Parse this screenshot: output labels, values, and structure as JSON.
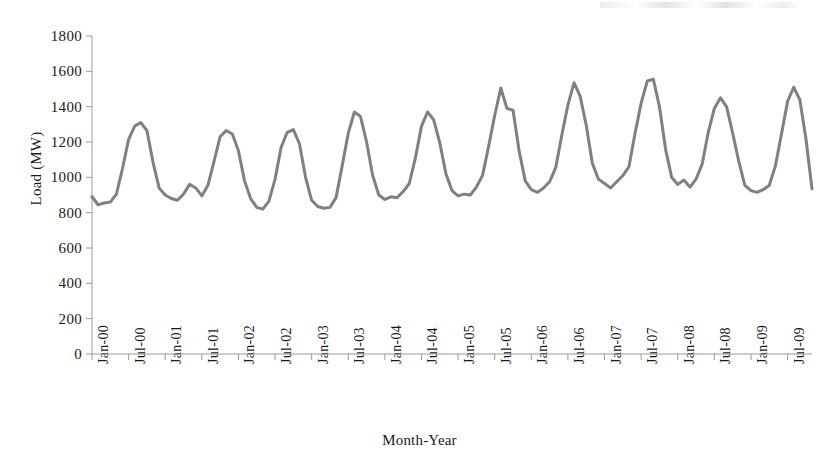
{
  "chart_data": {
    "type": "line",
    "title": "",
    "xlabel": "Month-Year",
    "ylabel": "Load (MW)",
    "ylim": [
      0,
      1800
    ],
    "ytick_step": 200,
    "yticks": [
      0,
      200,
      400,
      600,
      800,
      1000,
      1200,
      1400,
      1600,
      1800
    ],
    "grid": false,
    "legend": "none",
    "line_color": "#808080",
    "line_width": 3,
    "x_tick_labels": [
      "Jan-00",
      "Jul-00",
      "Jan-01",
      "Jul-01",
      "Jan-02",
      "Jul-02",
      "Jan-03",
      "Jul-03",
      "Jan-04",
      "Jul-04",
      "Jan-05",
      "Jul-05",
      "Jan-06",
      "Jul-06",
      "Jan-07",
      "Jul-07",
      "Jan-08",
      "Jul-08",
      "Jan-09",
      "Jul-09"
    ],
    "x_tick_indices": [
      0,
      6,
      12,
      18,
      24,
      30,
      36,
      42,
      48,
      54,
      60,
      66,
      72,
      78,
      84,
      90,
      96,
      102,
      108,
      114
    ],
    "x_start": "Jan-00",
    "x_end": "Nov-09",
    "series": [
      {
        "name": "Load",
        "values": [
          890,
          845,
          855,
          860,
          905,
          1050,
          1215,
          1290,
          1310,
          1265,
          1085,
          940,
          900,
          880,
          870,
          905,
          960,
          940,
          895,
          955,
          1090,
          1230,
          1265,
          1245,
          1150,
          980,
          880,
          830,
          820,
          865,
          990,
          1170,
          1255,
          1270,
          1190,
          1000,
          870,
          835,
          825,
          830,
          885,
          1065,
          1250,
          1370,
          1345,
          1200,
          1010,
          900,
          875,
          890,
          885,
          920,
          965,
          1110,
          1290,
          1370,
          1325,
          1195,
          1020,
          925,
          895,
          905,
          900,
          945,
          1010,
          1175,
          1350,
          1505,
          1390,
          1380,
          1150,
          980,
          930,
          915,
          940,
          975,
          1055,
          1240,
          1410,
          1535,
          1460,
          1295,
          1080,
          990,
          965,
          940,
          975,
          1010,
          1060,
          1250,
          1420,
          1545,
          1555,
          1400,
          1160,
          1000,
          960,
          985,
          945,
          990,
          1075,
          1255,
          1390,
          1450,
          1400,
          1250,
          1090,
          955,
          925,
          915,
          930,
          955,
          1065,
          1245,
          1430,
          1510,
          1440,
          1220,
          935
        ]
      }
    ],
    "peaks": [
      {
        "label": "Jul-00",
        "value": 1310
      },
      {
        "label": "Jul-01",
        "value": 1265
      },
      {
        "label": "Jul-02",
        "value": 1270
      },
      {
        "label": "Jul-03",
        "value": 1370
      },
      {
        "label": "Jul-04",
        "value": 1370
      },
      {
        "label": "Jul-05",
        "value": 1505
      },
      {
        "label": "Jul-06",
        "value": 1535
      },
      {
        "label": "Jul-07",
        "value": 1555
      },
      {
        "label": "Jul-08",
        "value": 1450
      },
      {
        "label": "Jul-09",
        "value": 1510
      }
    ]
  },
  "axis": {
    "y_title": "Load (MW)",
    "x_title": "Month-Year"
  }
}
